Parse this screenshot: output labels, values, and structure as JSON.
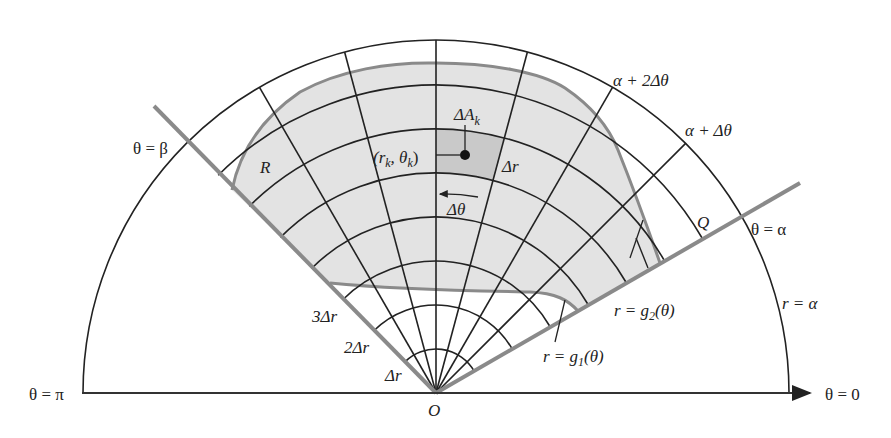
{
  "figure": {
    "colors": {
      "region_fill": "#e3e3e3",
      "highlight_cell": "#c9c9c9",
      "boundary_rays": "#8a8a8a",
      "grid_lines": "#222222",
      "background": "#ffffff"
    },
    "geometry": {
      "origin": [
        436,
        393
      ],
      "outer_radius_px": 353,
      "delta_r_px": 44,
      "grid_arcs": 7,
      "alpha_deg": 30,
      "beta_deg": 135,
      "delta_theta_deg": 15
    }
  },
  "labels": {
    "theta_beta": "θ = β",
    "theta_pi": "θ = π",
    "theta_zero": "θ = 0",
    "theta_alpha": "θ = α",
    "r_alpha": "r = α",
    "region_R": "R",
    "point": "(r",
    "point_sub_r": "k",
    "point_mid": ", θ",
    "point_sub_theta": "k",
    "point_close": ")",
    "delta_A": "ΔA",
    "delta_A_sub": "k",
    "delta_r": "Δr",
    "delta_theta": "Δθ",
    "alpha_plus_2dtheta": "α + 2Δθ",
    "alpha_plus_dtheta": "α + Δθ",
    "Q": "Q",
    "g2": "r = g",
    "g2_sub": "2",
    "g2_arg": "(θ)",
    "g1": "r = g",
    "g1_sub": "1",
    "g1_arg": "(θ)",
    "three_dr": "3Δr",
    "two_dr": "2Δr",
    "one_dr": "Δr",
    "origin": "O"
  }
}
